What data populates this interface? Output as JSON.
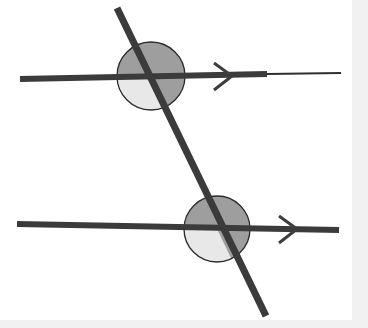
{
  "figure": {
    "width": 368,
    "height": 328,
    "background_color": "#ffffff",
    "margin_color": "#f1f1f1",
    "plate": {
      "x": 0,
      "y": 0,
      "width": 352,
      "height": 320
    }
  },
  "colors": {
    "line_dark": "#3b3b3b",
    "line_thin": "#2e2e2e",
    "sector_dark": "#9e9e9e",
    "sector_light": "#e8e8e8",
    "circle_outline": "#2b2b2b",
    "arrow_mark": "#3d3d3d"
  },
  "geometry": {
    "transversal": {
      "label": "transversal",
      "x1": 117,
      "y1": 8,
      "x2": 266,
      "y2": 316,
      "stroke_width": 7
    },
    "parallel_lines": [
      {
        "label": "upper-parallel-line",
        "x1": 20,
        "y1": 79,
        "x2": 267,
        "y2": 74,
        "stroke_width": 6,
        "tail_x2": 341,
        "tail_y2": 73,
        "tail_stroke_width": 2,
        "arrow_mark_x": 215,
        "arrow_mark_y": 76
      },
      {
        "label": "lower-parallel-line",
        "x1": 17,
        "y1": 224,
        "x2": 339,
        "y2": 230,
        "stroke_width": 6,
        "arrow_mark_x": 280,
        "arrow_mark_y": 229
      }
    ],
    "intersections": [
      {
        "label": "upper-intersection",
        "cx": 151,
        "cy": 76,
        "radius": 34,
        "sectors": [
          {
            "name": "upper-left-sector",
            "shade": "dark"
          },
          {
            "name": "upper-right-sector",
            "shade": "dark"
          },
          {
            "name": "lower-right-sector",
            "shade": "dark"
          },
          {
            "name": "lower-left-sector",
            "shade": "light"
          }
        ]
      },
      {
        "label": "lower-intersection",
        "cx": 217,
        "cy": 229,
        "radius": 33,
        "sectors": [
          {
            "name": "upper-left-sector",
            "shade": "dark"
          },
          {
            "name": "upper-right-sector",
            "shade": "dark"
          },
          {
            "name": "lower-right-sector",
            "shade": "dark"
          },
          {
            "name": "lower-left-sector",
            "shade": "light"
          }
        ]
      }
    ],
    "arrow_marks": [
      {
        "name": "upper-arrow-mark",
        "tip_x": 232,
        "tip_y": 76,
        "size": 18
      },
      {
        "name": "lower-arrow-mark",
        "tip_x": 297,
        "tip_y": 229,
        "size": 18
      }
    ]
  }
}
